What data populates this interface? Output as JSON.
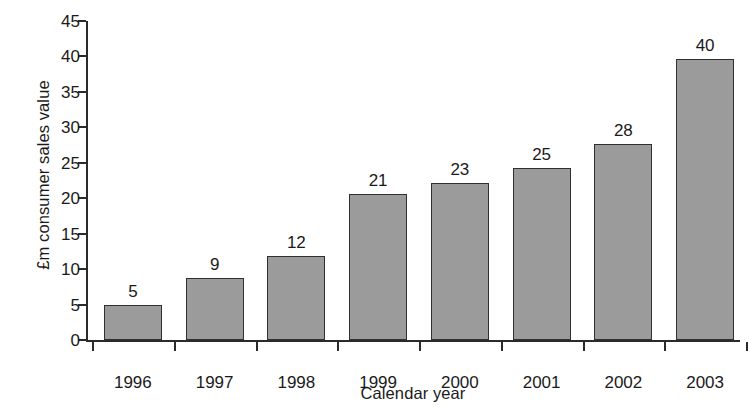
{
  "chart_data": {
    "type": "bar",
    "title": "",
    "subtitle": "",
    "xlabel": "Calendar year",
    "ylabel": "£m consumer sales value",
    "categories": [
      "1996",
      "1997",
      "1998",
      "1999",
      "2000",
      "2001",
      "2002",
      "2003"
    ],
    "values": [
      5,
      9,
      12,
      21,
      23,
      25,
      28,
      40
    ],
    "data_labels": [
      "5",
      "9",
      "12",
      "21",
      "23",
      "25",
      "28",
      "40"
    ],
    "plotted_heights": [
      5.0,
      8.7,
      11.8,
      20.6,
      22.1,
      24.3,
      27.7,
      39.7
    ],
    "ylim": [
      0,
      45
    ],
    "ytick_values": [
      0,
      5,
      10,
      15,
      20,
      25,
      30,
      35,
      40,
      45
    ],
    "ytick_labels": [
      "0",
      "5",
      "10",
      "15",
      "20",
      "25",
      "30",
      "35",
      "40",
      "45"
    ],
    "grid": false,
    "legend": null,
    "legend_position": "none",
    "annotations": [],
    "series": [
      {
        "name": "£m consumer sales value",
        "values": [
          5,
          9,
          12,
          21,
          23,
          25,
          28,
          40
        ]
      }
    ]
  },
  "style": {
    "bar_fill": "#9b9b9b",
    "bar_border": "#303030",
    "axis_color": "#2b2b2b",
    "text_color": "#1a1a1a",
    "background": "#ffffff"
  }
}
